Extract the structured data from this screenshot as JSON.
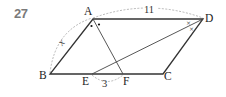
{
  "problem": {
    "number": "27"
  },
  "figure": {
    "shape": "parallelogram",
    "vertices": {
      "A": {
        "label": "A",
        "x": 93,
        "y": 19
      },
      "B": {
        "label": "B",
        "x": 50,
        "y": 74
      },
      "C": {
        "label": "C",
        "x": 163,
        "y": 74
      },
      "D": {
        "label": "D",
        "x": 203,
        "y": 19
      }
    },
    "points": {
      "E": {
        "label": "E",
        "x": 92,
        "y": 74
      },
      "F": {
        "label": "F",
        "x": 123,
        "y": 74
      }
    },
    "segments": [
      "AB",
      "BC",
      "CD",
      "DA",
      "AF",
      "DE"
    ],
    "measurements": {
      "AD": "11",
      "AB": "x",
      "EF": "3"
    },
    "angle_marks": {
      "A": "dot (bisected by AF)",
      "D": "cross (bisected by DE)"
    },
    "colors": {
      "line": "#333333",
      "dashed": "#999999",
      "number": "#7a7a7a"
    }
  }
}
